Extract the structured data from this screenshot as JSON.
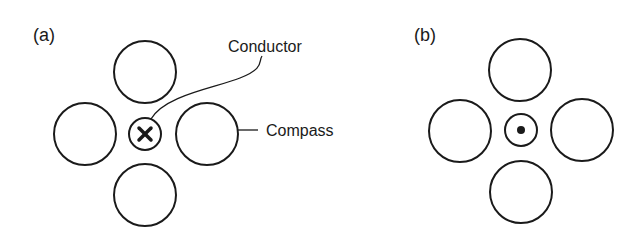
{
  "panels": [
    {
      "label": "(a)",
      "current_direction": "into-page",
      "center_symbol": "cross",
      "callouts": {
        "conductor": "Conductor",
        "compass": "Compass"
      }
    },
    {
      "label": "(b)",
      "current_direction": "out-of-page",
      "center_symbol": "dot"
    }
  ],
  "colors": {
    "stroke": "#1a1a1a",
    "background": "#ffffff"
  }
}
